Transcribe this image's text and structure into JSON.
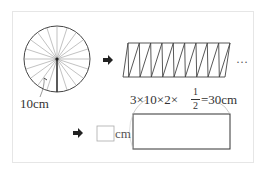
{
  "diagram": {
    "circle": {
      "radius_label": "10cm",
      "sectors": 20
    },
    "strip": {
      "teeth": 9,
      "continuation": "…"
    },
    "formula": {
      "prefix": "3×10×2×",
      "fraction_num": "1",
      "fraction_den": "2",
      "suffix": "=30cm"
    },
    "answer": {
      "blank_unit": "cm"
    },
    "colors": {
      "line": "#333333",
      "thin": "#999999",
      "frame": "#e6e6e6"
    }
  }
}
